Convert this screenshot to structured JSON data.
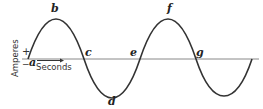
{
  "figure": {
    "points": {
      "a": "a",
      "b": "b",
      "c": "c",
      "d": "d",
      "e": "e",
      "f": "f",
      "g": "g"
    },
    "y_axis_label": "Amperes",
    "x_axis_label": "Seconds",
    "plus_sign": "+",
    "minus_sign": "−",
    "colors": {
      "line": "#333333",
      "axis": "#777777",
      "background": "#ffffff"
    }
  }
}
